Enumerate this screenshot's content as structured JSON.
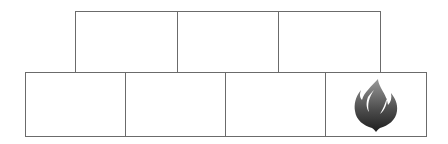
{
  "diagram": {
    "type": "brick-grid",
    "border_color": "#6b6b6b",
    "rows": [
      {
        "name": "top-row",
        "cells": [
          {
            "label": "",
            "icon": null
          },
          {
            "label": "",
            "icon": null
          },
          {
            "label": "",
            "icon": null
          }
        ]
      },
      {
        "name": "bottom-row",
        "cells": [
          {
            "label": "",
            "icon": null
          },
          {
            "label": "",
            "icon": null
          },
          {
            "label": "",
            "icon": null
          },
          {
            "label": "",
            "icon": "flame-icon"
          }
        ]
      }
    ],
    "icon_colors": {
      "flame_top": "#9a9a9a",
      "flame_bottom": "#1e1e1e"
    }
  }
}
